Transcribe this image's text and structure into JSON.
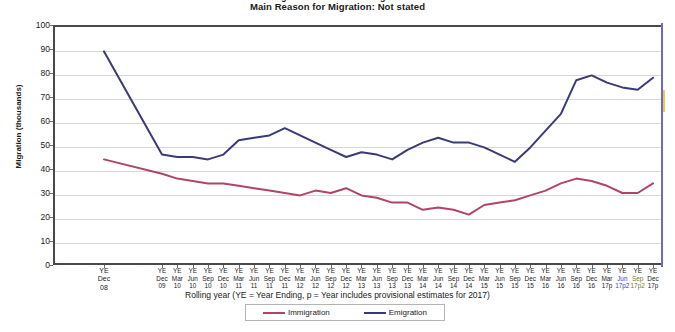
{
  "titles": {
    "clipped_top": "Long-Term International Migration",
    "subtitle": "Main Reason for Migration: Not stated"
  },
  "axes": {
    "y_title": "Migration (thousands)",
    "x_caption": "Rolling year (YE = Year Ending, p = Year includes provisional  estimates for  2017)"
  },
  "legend": {
    "immigration_label": "Immigration",
    "emigration_label": "Emigration",
    "immigration_color": "#b0446b",
    "emigration_color": "#3a3a7a"
  },
  "chart_data": {
    "type": "line",
    "title": "Main Reason for Migration: Not stated",
    "xlabel": "Rolling year (YE = Year Ending, p = Year includes provisional  estimates for  2017)",
    "ylabel": "Migration (thousands)",
    "ylim": [
      0,
      100
    ],
    "ytick_values": [
      0,
      10,
      20,
      30,
      40,
      50,
      60,
      70,
      80,
      90,
      100
    ],
    "grid": true,
    "legend_position": "bottom",
    "categories": [
      {
        "line1": "YE",
        "line2": "Dec",
        "line3": "08",
        "first": true
      },
      {
        "line1": "YE",
        "line2": "Dec",
        "line3": "09"
      },
      {
        "line1": "YE",
        "line2": "Mar",
        "line3": "10"
      },
      {
        "line1": "YE",
        "line2": "Jun",
        "line3": "10"
      },
      {
        "line1": "YE",
        "line2": "Sep",
        "line3": "10"
      },
      {
        "line1": "YE",
        "line2": "Dec",
        "line3": "10"
      },
      {
        "line1": "YE",
        "line2": "Mar",
        "line3": "11"
      },
      {
        "line1": "YE",
        "line2": "Jun",
        "line3": "11"
      },
      {
        "line1": "YE",
        "line2": "Sep",
        "line3": "11"
      },
      {
        "line1": "YE",
        "line2": "Dec",
        "line3": "11"
      },
      {
        "line1": "YE",
        "line2": "Mar",
        "line3": "12"
      },
      {
        "line1": "YE",
        "line2": "Jun",
        "line3": "12"
      },
      {
        "line1": "YE",
        "line2": "Sep",
        "line3": "12"
      },
      {
        "line1": "YE",
        "line2": "Dec",
        "line3": "12"
      },
      {
        "line1": "YE",
        "line2": "Mar",
        "line3": "13"
      },
      {
        "line1": "YE",
        "line2": "Jun",
        "line3": "13"
      },
      {
        "line1": "YE",
        "line2": "Sep",
        "line3": "13"
      },
      {
        "line1": "YE",
        "line2": "Dec",
        "line3": "13"
      },
      {
        "line1": "YE",
        "line2": "Mar",
        "line3": "14"
      },
      {
        "line1": "YE",
        "line2": "Jun",
        "line3": "14"
      },
      {
        "line1": "YE",
        "line2": "Sep",
        "line3": "14"
      },
      {
        "line1": "YE",
        "line2": "Dec",
        "line3": "14"
      },
      {
        "line1": "YE",
        "line2": "Mar",
        "line3": "15"
      },
      {
        "line1": "YE",
        "line2": "Jun",
        "line3": "15"
      },
      {
        "line1": "YE",
        "line2": "Sep",
        "line3": "15"
      },
      {
        "line1": "YE",
        "line2": "Dec",
        "line3": "15"
      },
      {
        "line1": "YE",
        "line2": "Mar",
        "line3": "16"
      },
      {
        "line1": "YE",
        "line2": "Jun",
        "line3": "16"
      },
      {
        "line1": "YE",
        "line2": "Sep",
        "line3": "16"
      },
      {
        "line1": "YE",
        "line2": "Dec",
        "line3": "16"
      },
      {
        "line1": "YE",
        "line2": "Mar",
        "line3": "17p"
      },
      {
        "line1": "YE",
        "line2": "Jun",
        "line3": "17p2",
        "accent": "blue"
      },
      {
        "line1": "YE",
        "line2": "Sep",
        "line3": "17p2",
        "accent": "olive"
      },
      {
        "line1": "YE",
        "line2": "Dec",
        "line3": "17p"
      }
    ],
    "series": [
      {
        "name": "Immigration",
        "color": "#b0446b",
        "values": [
          44,
          38,
          36,
          35,
          34,
          34,
          33,
          32,
          31,
          30,
          29,
          31,
          30,
          32,
          29,
          28,
          26,
          26,
          23,
          24,
          23,
          21,
          25,
          26,
          27,
          29,
          31,
          34,
          36,
          35,
          33,
          30,
          30,
          34
        ]
      },
      {
        "name": "Emigration",
        "color": "#3a3a7a",
        "values": [
          89,
          46,
          45,
          45,
          44,
          46,
          52,
          53,
          54,
          57,
          54,
          51,
          48,
          45,
          47,
          46,
          44,
          48,
          51,
          53,
          51,
          51,
          49,
          46,
          43,
          49,
          56,
          63,
          77,
          79,
          76,
          74,
          73,
          78
        ]
      }
    ]
  }
}
